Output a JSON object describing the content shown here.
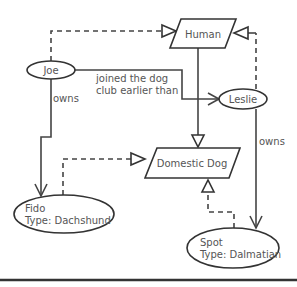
{
  "diagram": {
    "nodes": {
      "human": {
        "label": "Human",
        "shape": "parallelogram"
      },
      "domestic_dog": {
        "label": "Domestic Dog",
        "shape": "parallelogram"
      },
      "joe": {
        "label": "Joe",
        "shape": "ellipse"
      },
      "leslie": {
        "label": "Leslie",
        "shape": "ellipse"
      },
      "fido": {
        "line1": "Fido",
        "line2": "Type: Dachshund",
        "shape": "ellipse"
      },
      "spot": {
        "line1": "Spot",
        "line2": "Type: Dalmatian",
        "shape": "ellipse"
      }
    },
    "edges": {
      "joe_owns": {
        "label": "owns",
        "from": "Joe",
        "to": "Fido",
        "style": "solid-open-arrow"
      },
      "leslie_owns": {
        "label": "owns",
        "from": "Leslie",
        "to": "Spot",
        "style": "solid-open-arrow"
      },
      "joined": {
        "line1": "joined the dog",
        "line2": "club earlier than",
        "from": "Joe",
        "to": "Leslie",
        "style": "solid-open-arrow"
      },
      "human_dog": {
        "from": "Human",
        "to": "Domestic Dog",
        "style": "solid-hollow-triangle"
      },
      "joe_human": {
        "from": "Joe",
        "to": "Human",
        "style": "dashed-hollow-triangle"
      },
      "leslie_human": {
        "from": "Leslie",
        "to": "Human",
        "style": "dashed-hollow-triangle"
      },
      "fido_dog": {
        "from": "Fido",
        "to": "Domestic Dog",
        "style": "dashed-hollow-triangle"
      },
      "spot_dog": {
        "from": "Spot",
        "to": "Domestic Dog",
        "style": "dashed-hollow-triangle"
      }
    },
    "colors": {
      "stroke": "#444444",
      "text": "#555555",
      "background": "#ffffff"
    }
  }
}
